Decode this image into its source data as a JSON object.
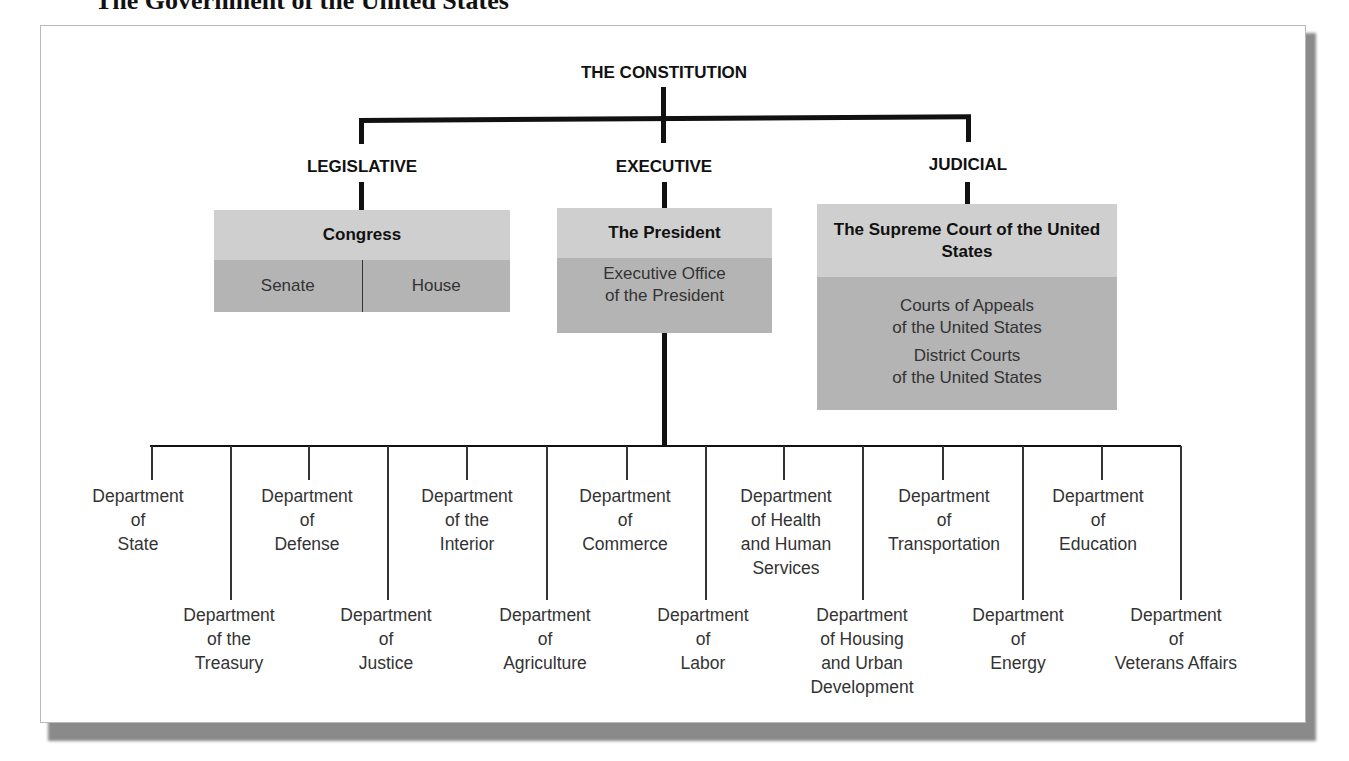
{
  "page": {
    "title": "The Government of the United States"
  },
  "chart": {
    "root": "THE CONSTITUTION",
    "branches": {
      "legislative": {
        "label": "LEGISLATIVE",
        "head": "Congress",
        "subunits": [
          "Senate",
          "House"
        ]
      },
      "executive": {
        "label": "EXECUTIVE",
        "head": "The President",
        "office": "Executive Office\nof the President"
      },
      "judicial": {
        "label": "JUDICIAL",
        "head": "The Supreme Court of the United States",
        "courts": [
          "Courts of Appeals\nof the United States",
          "District Courts\nof the United States"
        ]
      }
    },
    "departments_upper": [
      "Department\nof\nState",
      "Department\nof\nDefense",
      "Department\nof  the\nInterior",
      "Department\nof\nCommerce",
      "Department\nof  Health\nand Human\nServices",
      "Department\nof\nTransportation",
      "Department\nof\nEducation"
    ],
    "departments_lower": [
      "Department\nof the\nTreasury",
      "Department\nof\nJustice",
      "Department\nof\nAgriculture",
      "Department\nof\nLabor",
      "Department\nof Housing\nand Urban\nDevelopment",
      "Department\nof\nEnergy",
      "Department\nof\nVeterans Affairs"
    ]
  },
  "colors": {
    "box_head": "#cfcfcf",
    "box_body": "#b4b4b4",
    "line": "#111111"
  }
}
